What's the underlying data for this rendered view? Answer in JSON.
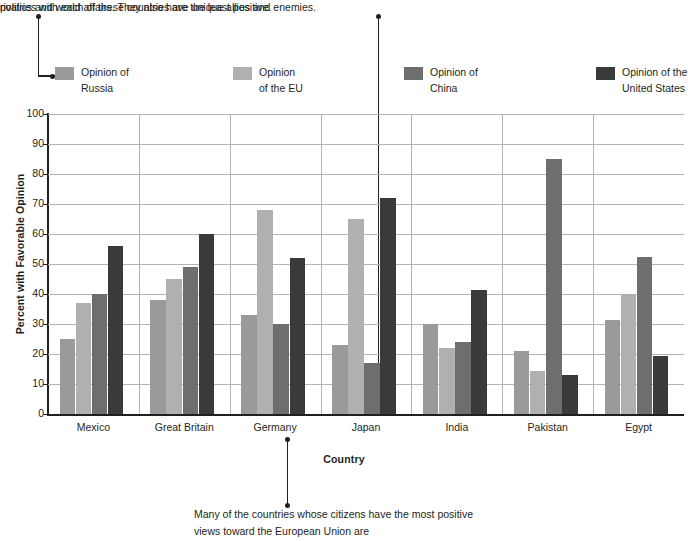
{
  "annotations": {
    "top_left": "politics and world affairs. They also have unique allies and enemies.",
    "top_right": "rivalries with each of these countries are the least positive.",
    "bottom_line1": "Many of the countries whose citizens have the",
    "bottom_line2": "most positive views toward the European Union are"
  },
  "legend": {
    "items": [
      {
        "label_line1": "Opinion of",
        "label_line2": "Russia",
        "color": "#9a9a9a"
      },
      {
        "label_line1": "Opinion",
        "label_line2": "of the EU",
        "color": "#b0b0b0"
      },
      {
        "label_line1": "Opinion of",
        "label_line2": "China",
        "color": "#6e6e6e"
      },
      {
        "label_line1": "Opinion of the",
        "label_line2": "United States",
        "color": "#3a3a3a"
      }
    ]
  },
  "chart_data": {
    "type": "bar",
    "title": "",
    "xlabel": "Country",
    "ylabel": "Percent with Favorable Opinion",
    "ylim": [
      0,
      100
    ],
    "yticks": [
      0,
      10,
      20,
      30,
      40,
      50,
      60,
      70,
      80,
      90,
      100
    ],
    "grid": true,
    "legend_position": "top",
    "categories": [
      "Mexico",
      "Great Britain",
      "Germany",
      "Japan",
      "India",
      "Pakistan",
      "Egypt"
    ],
    "series": [
      {
        "name": "Opinion of Russia",
        "color": "#9a9a9a",
        "values": [
          25,
          38,
          33,
          23,
          30,
          21,
          31.5
        ]
      },
      {
        "name": "Opinion of the EU",
        "color": "#b0b0b0",
        "values": [
          37,
          45,
          68,
          65,
          22,
          14.5,
          40
        ]
      },
      {
        "name": "Opinion of China",
        "color": "#6e6e6e",
        "values": [
          40,
          49,
          30,
          17,
          24,
          85,
          52.5
        ]
      },
      {
        "name": "Opinion of the United States",
        "color": "#3a3a3a",
        "values": [
          56,
          60,
          52,
          72,
          41.5,
          13,
          19.5
        ]
      }
    ]
  }
}
